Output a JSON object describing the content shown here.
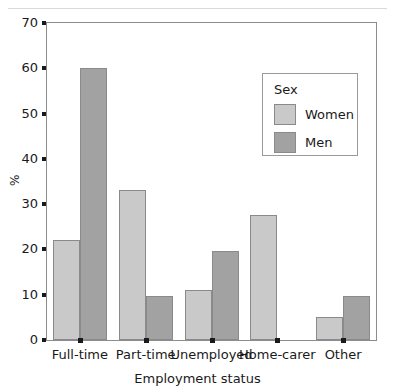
{
  "chart_data": {
    "type": "bar",
    "title": "",
    "xlabel": "Employment status",
    "ylabel": "%",
    "categories": [
      "Full-time",
      "Part-time",
      "Unemployed",
      "Home-carer",
      "Other"
    ],
    "series": [
      {
        "name": "Women",
        "color": "#c9c9c9",
        "values": [
          22,
          33.2,
          11,
          27.5,
          5
        ]
      },
      {
        "name": "Men",
        "color": "#a2a2a2",
        "values": [
          60,
          9.7,
          19.7,
          0,
          9.7
        ]
      }
    ],
    "ylim": [
      0,
      70
    ],
    "yticks": [
      0,
      10,
      20,
      30,
      40,
      50,
      60,
      70
    ],
    "ytick_labels": [
      "0",
      "10",
      "20",
      "30",
      "40",
      "50",
      "60",
      "70"
    ],
    "grid": false,
    "legend": {
      "title": "Sex",
      "position": "upper-right-inside",
      "entries": [
        "Women",
        "Men"
      ]
    }
  },
  "legend": {
    "title": "Sex",
    "items": [
      {
        "label": "Women",
        "color": "#c9c9c9"
      },
      {
        "label": "Men",
        "color": "#a2a2a2"
      }
    ]
  },
  "axes": {
    "x_title": "Employment status",
    "y_title": "%",
    "y_ticks": [
      "0",
      "10",
      "20",
      "30",
      "40",
      "50",
      "60",
      "70"
    ],
    "x_ticks": [
      "Full-time",
      "Part-time",
      "Unemployed",
      "Home-carer",
      "Other"
    ]
  }
}
